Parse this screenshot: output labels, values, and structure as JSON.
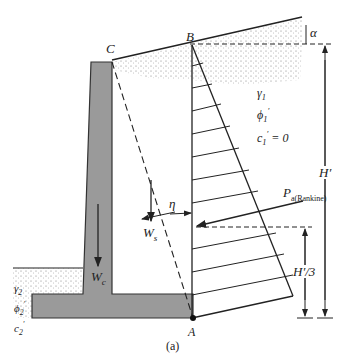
{
  "figure": {
    "caption": "(a)",
    "points": {
      "C": "C",
      "B": "B",
      "A": "A"
    },
    "slope_angle": "α",
    "backfill_soil": {
      "gamma": "γ",
      "gamma_sub": "1",
      "phi": "ϕ",
      "phi_sub": "1",
      "phi_sup": "′",
      "c": "c",
      "c_sub": "1",
      "c_sup": "′",
      "c_value": " = 0"
    },
    "foundation_soil": {
      "gamma": "γ",
      "gamma_sub": "2",
      "phi": "ϕ",
      "phi_sub": "2",
      "phi_sup": "′",
      "c": "c",
      "c_sub": "2",
      "c_sup": "′"
    },
    "wall_weight": {
      "symbol": "W",
      "sub": "c"
    },
    "soil_weight": {
      "symbol": "W",
      "sub": "s"
    },
    "eta": "η",
    "active_force": {
      "symbol": "P",
      "sub": "a(Rankine)"
    },
    "height": "H′",
    "third_height": "H′/3"
  },
  "colors": {
    "concrete": "#9a9a9a",
    "line": "#222222",
    "soil_dots": "#555555"
  }
}
